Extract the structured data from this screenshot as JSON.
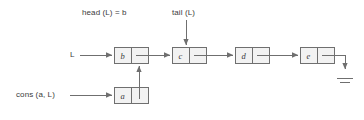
{
  "figure": {
    "type": "linked-list-diagram",
    "colors": {
      "stroke": "#6f6f6f",
      "box_fill": "#f2f2f2",
      "text": "#3b3b3b",
      "background": "#ffffff"
    }
  },
  "labels": {
    "head": "head (L) = b",
    "tail": "tail (L)",
    "list_pointer": "L",
    "cons": "cons (a, L)"
  },
  "nodes": [
    {
      "id": "node-b",
      "value": "b",
      "x": 114,
      "y": 47,
      "width": 34,
      "height": 16
    },
    {
      "id": "node-c",
      "value": "c",
      "x": 172,
      "y": 47,
      "width": 34,
      "height": 16
    },
    {
      "id": "node-d",
      "value": "d",
      "x": 235,
      "y": 47,
      "width": 34,
      "height": 16
    },
    {
      "id": "node-e",
      "value": "e",
      "x": 300,
      "y": 47,
      "width": 34,
      "height": 16
    },
    {
      "id": "node-a",
      "value": "a",
      "x": 114,
      "y": 87,
      "width": 34,
      "height": 16
    }
  ],
  "connections": [
    {
      "from": "list_pointer",
      "to": "node-b",
      "kind": "arrow-right"
    },
    {
      "from": "node-b",
      "to": "node-c",
      "kind": "arrow-right"
    },
    {
      "from": "node-c",
      "to": "node-d",
      "kind": "arrow-right"
    },
    {
      "from": "node-d",
      "to": "node-e",
      "kind": "arrow-right"
    },
    {
      "from": "node-e",
      "to": "ground",
      "kind": "arrow-down-ground"
    },
    {
      "from": "node-a",
      "to": "node-b",
      "kind": "arrow-up"
    },
    {
      "from": "cons",
      "to": "node-a",
      "kind": "arrow-right"
    },
    {
      "from": "tail",
      "to": "node-c",
      "kind": "arrow-down"
    }
  ],
  "terminator": {
    "name": "ground-symbol",
    "x": 340,
    "y": 72
  }
}
